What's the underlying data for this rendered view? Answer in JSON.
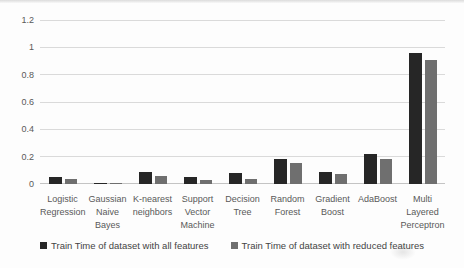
{
  "chart_data": {
    "type": "bar",
    "categories": [
      "Logistic Regression",
      "Gaussian Naive Bayes",
      "K-nearest neighbors",
      "Support Vector Machine",
      "Decision Tree",
      "Random Forest",
      "Gradient Boost",
      "AdaBoost",
      "Multi Layered Perceptron"
    ],
    "series": [
      {
        "name": "Train Time of dataset with all features",
        "color": "#262626",
        "values": [
          0.05,
          0.01,
          0.09,
          0.05,
          0.08,
          0.18,
          0.09,
          0.22,
          0.96
        ]
      },
      {
        "name": "Train Time of dataset with reduced features",
        "color": "#6f6f6f",
        "values": [
          0.04,
          0.01,
          0.06,
          0.03,
          0.04,
          0.15,
          0.07,
          0.18,
          0.91
        ]
      }
    ],
    "ylim": [
      0,
      1.2
    ],
    "yticks": [
      0,
      0.2,
      0.4,
      0.6,
      0.8,
      1,
      1.2
    ],
    "ytick_labels": [
      "0",
      "0.2",
      "0.4",
      "0.6",
      "0.8",
      "1",
      "1.2"
    ],
    "grid": "horizontal",
    "legend_position": "bottom",
    "xlabel": "",
    "ylabel": ""
  },
  "colors": {
    "gridline": "#dadada",
    "axis_line": "#c4c4c4",
    "tick_text": "#595959",
    "legend_text": "#444444",
    "background": "#fdfdfd"
  }
}
